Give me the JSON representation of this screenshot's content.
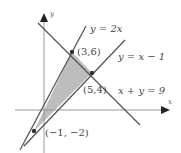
{
  "diagram": {
    "type": "linear-inequality-feasible-region",
    "axes": {
      "x_label": "x",
      "y_label": "y"
    },
    "lines": [
      {
        "id": "line1",
        "label": "y = 2x"
      },
      {
        "id": "line2",
        "label": "y = x − 1"
      },
      {
        "id": "line3",
        "label": "x + y = 9"
      }
    ],
    "vertices": [
      {
        "label": "(3,6)"
      },
      {
        "label": "(5,4)"
      },
      {
        "label": "(−1, −2)"
      }
    ],
    "colors": {
      "line": "#555555",
      "shading": "#bdbdbd",
      "axis": "#888888",
      "text": "#444444"
    }
  }
}
